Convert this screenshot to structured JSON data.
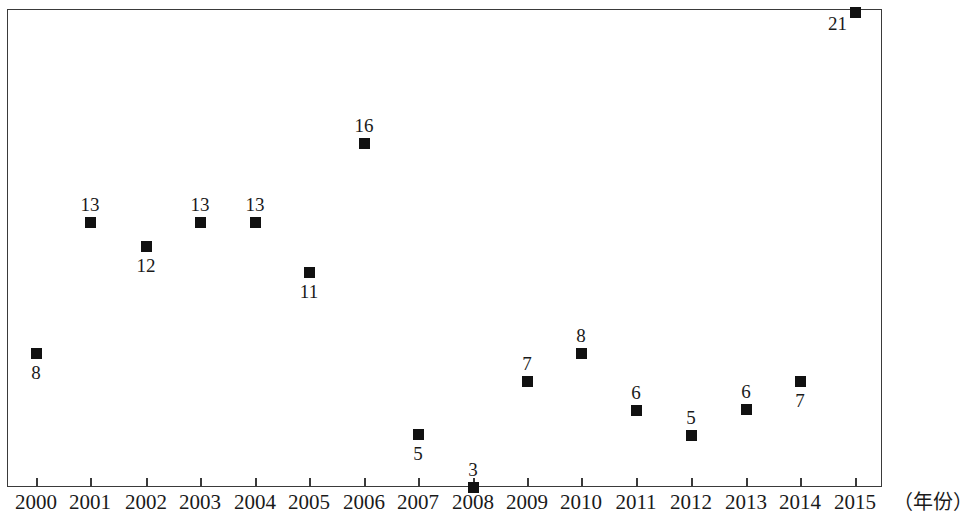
{
  "chart_data": {
    "type": "scatter",
    "title": "",
    "subtitle": "",
    "xlabel": "（年份）",
    "ylabel": "",
    "grid": false,
    "legend": null,
    "xlim": [
      2000,
      2015
    ],
    "ylim": [
      0,
      21
    ],
    "categories": [
      "2000",
      "2001",
      "2002",
      "2003",
      "2004",
      "2005",
      "2006",
      "2007",
      "2008",
      "2009",
      "2010",
      "2011",
      "2012",
      "2013",
      "2014",
      "2015"
    ],
    "values": [
      8,
      13,
      12,
      13,
      13,
      11,
      16,
      5,
      3,
      7,
      8,
      6,
      5,
      6,
      7,
      21
    ],
    "points": [
      {
        "x": "2000",
        "y": 8,
        "label": "8",
        "label_pos": "below"
      },
      {
        "x": "2001",
        "y": 13,
        "label": "13",
        "label_pos": "above"
      },
      {
        "x": "2002",
        "y": 12,
        "label": "12",
        "label_pos": "below"
      },
      {
        "x": "2003",
        "y": 13,
        "label": "13",
        "label_pos": "above"
      },
      {
        "x": "2004",
        "y": 13,
        "label": "13",
        "label_pos": "above"
      },
      {
        "x": "2005",
        "y": 11,
        "label": "11",
        "label_pos": "below"
      },
      {
        "x": "2006",
        "y": 16,
        "label": "16",
        "label_pos": "above"
      },
      {
        "x": "2007",
        "y": 5,
        "label": "5",
        "label_pos": "below"
      },
      {
        "x": "2008",
        "y": 3,
        "label": "3",
        "label_pos": "above"
      },
      {
        "x": "2009",
        "y": 7,
        "label": "7",
        "label_pos": "above"
      },
      {
        "x": "2010",
        "y": 8,
        "label": "8",
        "label_pos": "above"
      },
      {
        "x": "2011",
        "y": 6,
        "label": "6",
        "label_pos": "above"
      },
      {
        "x": "2012",
        "y": 5,
        "label": "5",
        "label_pos": "above"
      },
      {
        "x": "2013",
        "y": 6,
        "label": "6",
        "label_pos": "above"
      },
      {
        "x": "2014",
        "y": 7,
        "label": "7",
        "label_pos": "below"
      },
      {
        "x": "2015",
        "y": 21,
        "label": "21",
        "label_pos": "left"
      }
    ],
    "marker": {
      "shape": "square",
      "color": "#111111",
      "size": 11
    },
    "axis_color": "#3a3a3a"
  },
  "geometry": {
    "point_px": [
      {
        "cx": 36,
        "cy": 353
      },
      {
        "cx": 90,
        "cy": 222
      },
      {
        "cx": 146,
        "cy": 246
      },
      {
        "cx": 200,
        "cy": 222
      },
      {
        "cx": 255,
        "cy": 222
      },
      {
        "cx": 309,
        "cy": 272
      },
      {
        "cx": 364,
        "cy": 143
      },
      {
        "cx": 418,
        "cy": 434
      },
      {
        "cx": 473,
        "cy": 487
      },
      {
        "cx": 527,
        "cy": 381
      },
      {
        "cx": 581,
        "cy": 353
      },
      {
        "cx": 636,
        "cy": 410
      },
      {
        "cx": 691,
        "cy": 435
      },
      {
        "cx": 746,
        "cy": 409
      },
      {
        "cx": 800,
        "cy": 381
      },
      {
        "cx": 855,
        "cy": 12
      }
    ],
    "tick_px": [
      36,
      90,
      146,
      200,
      255,
      309,
      364,
      418,
      473,
      527,
      581,
      636,
      691,
      746,
      800,
      855
    ]
  }
}
